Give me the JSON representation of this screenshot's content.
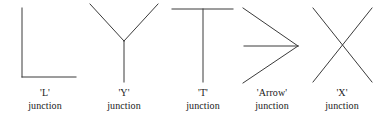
{
  "figure": {
    "background_color": "#ffffff",
    "stroke_color": "#3a3a3a",
    "stroke_width": 1,
    "caption_suffix": "junction",
    "junctions": [
      {
        "name": "'L'",
        "letter": "L",
        "caption_word": "junction",
        "icon": "l-junction-icon",
        "cell": {
          "left": 0,
          "width": 90
        },
        "strokes": [
          {
            "x1": 22,
            "y1": 8,
            "x2": 22,
            "y2": 77
          },
          {
            "x1": 22,
            "y1": 77,
            "x2": 76,
            "y2": 77
          }
        ]
      },
      {
        "name": "'Y'",
        "letter": "Y",
        "caption_word": "junction",
        "icon": "y-junction-icon",
        "cell": {
          "left": 83,
          "width": 82
        },
        "strokes": [
          {
            "x1": 7,
            "y1": 4,
            "x2": 41,
            "y2": 41
          },
          {
            "x1": 75,
            "y1": 4,
            "x2": 41,
            "y2": 41
          },
          {
            "x1": 41,
            "y1": 41,
            "x2": 41,
            "y2": 82
          }
        ]
      },
      {
        "name": "'T'",
        "letter": "T",
        "caption_word": "junction",
        "icon": "t-junction-icon",
        "cell": {
          "left": 165,
          "width": 76
        },
        "strokes": [
          {
            "x1": 7,
            "y1": 9,
            "x2": 68,
            "y2": 9
          },
          {
            "x1": 38,
            "y1": 9,
            "x2": 38,
            "y2": 82
          }
        ]
      },
      {
        "name": "'Arrow'",
        "letter": "Arrow",
        "caption_word": "junction",
        "icon": "arrow-junction-icon",
        "cell": {
          "left": 238,
          "width": 68
        },
        "strokes": [
          {
            "x1": 5,
            "y1": 8,
            "x2": 60,
            "y2": 46
          },
          {
            "x1": 5,
            "y1": 83,
            "x2": 60,
            "y2": 46
          },
          {
            "x1": 6,
            "y1": 46,
            "x2": 60,
            "y2": 46
          }
        ]
      },
      {
        "name": "'X'",
        "letter": "X",
        "caption_word": "junction",
        "icon": "x-junction-icon",
        "cell": {
          "left": 303,
          "width": 78
        },
        "strokes": [
          {
            "x1": 10,
            "y1": 8,
            "x2": 69,
            "y2": 82
          },
          {
            "x1": 69,
            "y1": 8,
            "x2": 10,
            "y2": 82
          }
        ]
      }
    ]
  }
}
